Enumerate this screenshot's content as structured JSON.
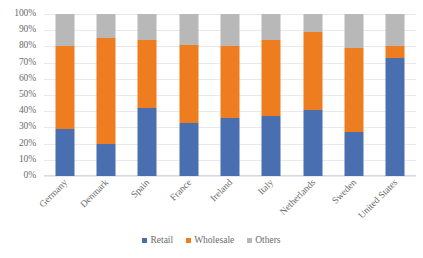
{
  "chart_data": {
    "type": "bar",
    "subtype": "stacked-100-percent",
    "title": "",
    "xlabel": "",
    "ylabel": "",
    "ylim": [
      0,
      100
    ],
    "y_tick_labels": [
      "100%",
      "90%",
      "80%",
      "70%",
      "60%",
      "50%",
      "40%",
      "30%",
      "20%",
      "10%",
      "0%"
    ],
    "y_tick_values": [
      100,
      90,
      80,
      70,
      60,
      50,
      40,
      30,
      20,
      10,
      0
    ],
    "grid": true,
    "legend_position": "bottom",
    "categories": [
      "Germany",
      "Denmark",
      "Spain",
      "France",
      "Ireland",
      "Italy",
      "Netherlands",
      "Sweden",
      "United States"
    ],
    "series": [
      {
        "name": "Retail",
        "color": "#4a6fb0",
        "values": [
          29,
          20,
          42,
          33,
          36,
          37,
          41,
          27,
          73
        ]
      },
      {
        "name": "Wholesale",
        "color": "#ed7d1f",
        "values": [
          51,
          65,
          42,
          48,
          44,
          47,
          48,
          52,
          7
        ]
      },
      {
        "name": "Others",
        "color": "#b8b8b8",
        "values": [
          20,
          15,
          16,
          19,
          20,
          16,
          11,
          21,
          20
        ]
      }
    ]
  },
  "legend": {
    "items": [
      {
        "label": "Retail",
        "color": "#4a6fb0"
      },
      {
        "label": "Wholesale",
        "color": "#ed7d1f"
      },
      {
        "label": "Others",
        "color": "#b8b8b8"
      }
    ]
  }
}
